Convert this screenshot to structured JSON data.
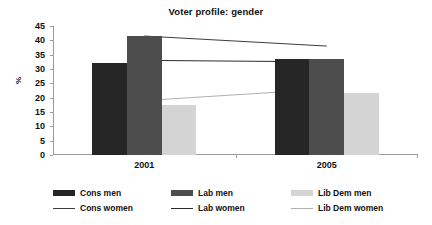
{
  "chart_data": {
    "type": "bar",
    "title": "Voter profile: gender",
    "xlabel": "",
    "ylabel": "%",
    "categories": [
      "2001",
      "2005"
    ],
    "ylim": [
      0,
      45
    ],
    "ytick_step": 5,
    "yticks": [
      "0",
      "5",
      "10",
      "15",
      "20",
      "25",
      "30",
      "35",
      "40",
      "45"
    ],
    "grid": false,
    "legend_position": "bottom",
    "bar_series": [
      {
        "name": "Cons men",
        "values": [
          32.0,
          33.5
        ],
        "color": "#262626"
      },
      {
        "name": "Lab men",
        "values": [
          41.5,
          33.5
        ],
        "color": "#4d4d4d"
      },
      {
        "name": "Lib Dem men",
        "values": [
          17.5,
          21.5
        ],
        "color": "#d4d4d4"
      }
    ],
    "line_series": [
      {
        "name": "Cons women",
        "values": [
          41.5,
          38.0
        ],
        "color": "#3d3d3d"
      },
      {
        "name": "Lab women",
        "values": [
          33.0,
          32.5
        ],
        "color": "#2b2b2b"
      },
      {
        "name": "Lib Dem women",
        "values": [
          19.0,
          23.0
        ],
        "color": "#b0b0b0"
      }
    ]
  }
}
